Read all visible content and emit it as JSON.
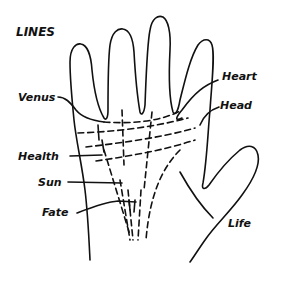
{
  "title": "LINES",
  "labels": {
    "venus": "Venus",
    "heart": "Heart",
    "head": "Head",
    "health": "Health",
    "sun": "Sun",
    "fate": "Fate",
    "life": "Life"
  },
  "colors": {
    "ink": "#111111",
    "background": "#ffffff"
  }
}
